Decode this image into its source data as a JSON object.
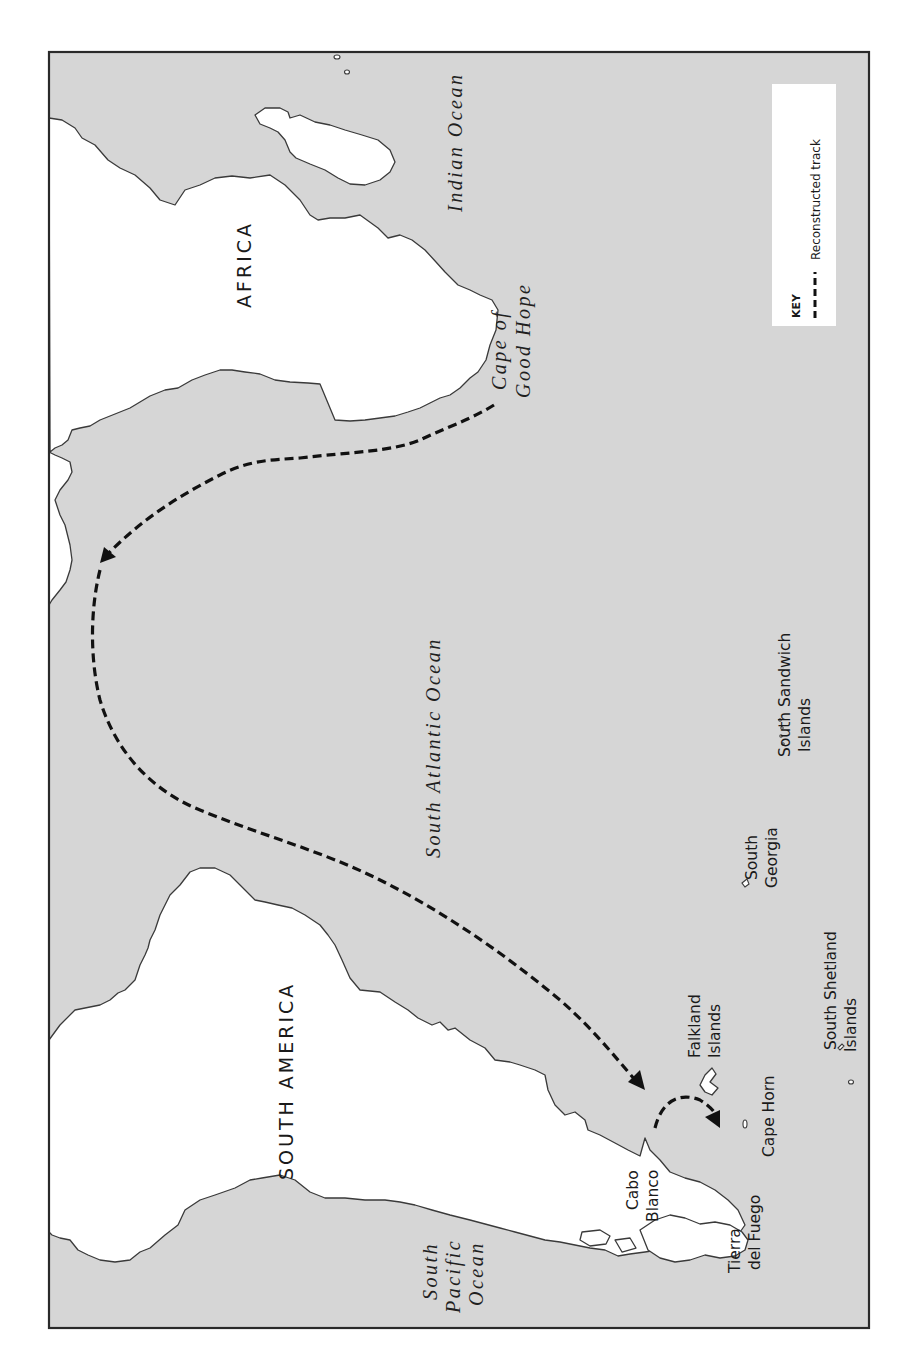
{
  "map": {
    "orientation": "rotated-90-counterclockwise",
    "colors": {
      "sea": "#d6d6d6",
      "land": "#ffffff",
      "coastline": "#3a3a3a",
      "track": "#111111",
      "frame": "#2a2a2a"
    },
    "continents": {
      "africa": "AFRICA",
      "south_america": "SOUTH AMERICA"
    },
    "oceans": {
      "indian": "Indian Ocean",
      "south_atlantic": "South Atlantic Ocean",
      "south_pacific_line1": "South",
      "south_pacific_line2": "Pacific",
      "south_pacific_line3": "Ocean"
    },
    "places": {
      "cape_good_hope_line1": "Cape of",
      "cape_good_hope_line2": "Good Hope",
      "cabo_blanco_line1": "Cabo",
      "cabo_blanco_line2": "Blanco",
      "tierra_del_fuego_line1": "Tierra",
      "tierra_del_fuego_line2": "del Fuego",
      "cape_horn": "Cape Horn",
      "falkland_line1": "Falkland",
      "falkland_line2": "Islands",
      "south_georgia_line1": "South",
      "south_georgia_line2": "Georgia",
      "south_sandwich_line1": "South Sandwich",
      "south_sandwich_line2": "Islands",
      "south_shetland_line1": "South Shetland",
      "south_shetland_line2": "Islands"
    },
    "key": {
      "title": "KEY",
      "items": [
        {
          "symbol": "dashed-line",
          "label": "Reconstructed track"
        }
      ]
    }
  }
}
